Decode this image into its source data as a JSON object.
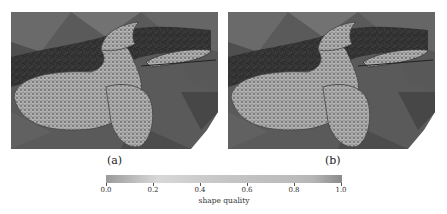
{
  "figure": {
    "panels": [
      {
        "id": "a",
        "label": "(a)",
        "content": "propeller-mesh-render"
      },
      {
        "id": "b",
        "label": "(b)",
        "content": "propeller-mesh-render"
      }
    ],
    "colorbar": {
      "title": "shape quality",
      "ticks": [
        "0.0",
        "0.2",
        "0.4",
        "0.6",
        "0.8",
        "1.0"
      ],
      "range": [
        0.0,
        1.0
      ],
      "colors": {
        "low": "#9a9a9a",
        "mid": "#d8d8d8",
        "high": "#8a8a8a"
      }
    }
  }
}
